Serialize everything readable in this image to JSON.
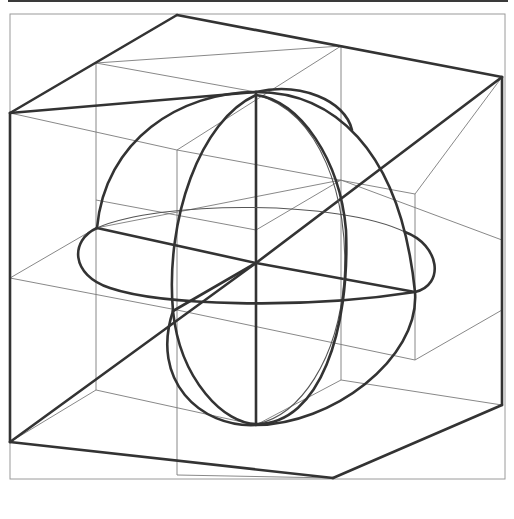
{
  "figure": {
    "colors": {
      "background": "#ffffff",
      "thick_line": "#333333",
      "thin_line": "#7a7a7a",
      "frame": "#9a9a9a"
    }
  },
  "geometry": {
    "top_bar": {
      "x": 8,
      "y": 0,
      "w": 500,
      "h": 2
    },
    "frame": {
      "x": 10,
      "y": 14,
      "w": 495,
      "h": 465
    },
    "cube_thick_edges": [
      [
        177,
        15,
        502,
        77
      ],
      [
        177,
        15,
        10,
        113
      ],
      [
        177,
        15,
        177,
        15
      ],
      [
        10,
        113,
        10,
        442
      ],
      [
        502,
        77,
        502,
        405
      ],
      [
        10,
        442,
        333,
        478
      ],
      [
        333,
        478,
        502,
        405
      ],
      [
        256,
        92,
        256,
        425
      ],
      [
        10,
        113,
        256,
        92
      ],
      [
        256,
        263,
        502,
        77
      ],
      [
        10,
        442,
        256,
        263
      ],
      [
        173,
        311,
        256,
        263
      ],
      [
        256,
        263,
        415,
        292
      ],
      [
        97,
        228,
        256,
        263
      ]
    ],
    "cube_thin_edges": [
      [
        96,
        63,
        341,
        46
      ],
      [
        96,
        63,
        96,
        390
      ],
      [
        341,
        46,
        341,
        380
      ],
      [
        96,
        63,
        256,
        92
      ],
      [
        341,
        46,
        502,
        77
      ],
      [
        10,
        113,
        177,
        150
      ],
      [
        177,
        150,
        341,
        46
      ],
      [
        177,
        150,
        177,
        475
      ],
      [
        177,
        150,
        415,
        194
      ],
      [
        415,
        194,
        502,
        77
      ],
      [
        415,
        194,
        415,
        360
      ],
      [
        96,
        200,
        256,
        230
      ],
      [
        256,
        230,
        341,
        180
      ],
      [
        10,
        278,
        177,
        310
      ],
      [
        10,
        278,
        96,
        228
      ],
      [
        96,
        228,
        341,
        180
      ],
      [
        177,
        310,
        415,
        360
      ],
      [
        415,
        360,
        502,
        310
      ],
      [
        96,
        390,
        256,
        425
      ],
      [
        256,
        425,
        341,
        380
      ],
      [
        341,
        380,
        502,
        405
      ],
      [
        10,
        442,
        96,
        390
      ],
      [
        177,
        475,
        333,
        478
      ],
      [
        96,
        228,
        96,
        228
      ],
      [
        341,
        180,
        502,
        240
      ],
      [
        256,
        92,
        256,
        92
      ]
    ],
    "sphere": {
      "outline_path": "M 97 228 C 105 140 180 92 256 92 C 330 92 400 145 415 292 C 420 360 330 425 256 425 C 200 428 150 380 173 311",
      "meridian_thick_path": "M 256 95 C 200 120 165 220 173 311 C 180 380 225 425 257 424 C 320 424 350 330 346 230 C 340 160 300 100 256 95",
      "meridian_thin_path": "M 256 95 C 320 110 350 200 344 280 C 338 360 300 415 257 424",
      "equator_thick_path": "M 97 228 C 70 240 70 275 110 288 C 160 305 300 310 415 292 C 445 285 440 245 405 232",
      "equator_thin_path": "M 97 228 C 160 200 340 200 405 232",
      "top_cap_path": "M 256 92 C 300 82 345 100 352 130"
    }
  }
}
